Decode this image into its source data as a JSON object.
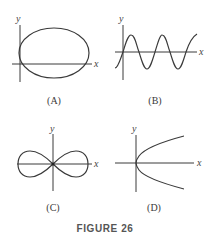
{
  "figure": {
    "caption": "FIGURE 26",
    "colors": {
      "ink": "#3a3a3a",
      "background": "#ffffff",
      "caption": "#555555"
    },
    "panels": [
      {
        "id": "A",
        "label": "(A)",
        "curve": "ellipse",
        "description": "Ellipse tangent to the y-axis, crossing the x-axis",
        "x_axis_label": "x",
        "y_axis_label": "y"
      },
      {
        "id": "B",
        "label": "(B)",
        "curve": "sine-wave",
        "description": "Sinusoidal wave passing through the origin",
        "x_axis_label": "x",
        "y_axis_label": "y"
      },
      {
        "id": "C",
        "label": "(C)",
        "curve": "lemniscate",
        "description": "Figure-eight (lemniscate) centered at origin",
        "x_axis_label": "x",
        "y_axis_label": "y"
      },
      {
        "id": "D",
        "label": "(D)",
        "curve": "sideways-parabola",
        "description": "Parabola opening to the right with vertex at origin",
        "x_axis_label": "x",
        "y_axis_label": "y"
      }
    ]
  }
}
